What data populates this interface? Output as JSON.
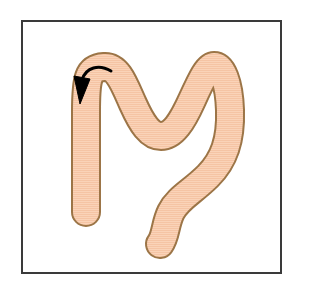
{
  "figure": {
    "title": "Anatomical diagram of a tubular organ with directional flow arrow",
    "caption": "",
    "background_color": "#ffffff"
  },
  "frame": {
    "name": "figure-border",
    "x": 21,
    "y": 20,
    "width": 261,
    "height": 254,
    "stroke_color": "#3a3a3a",
    "stroke_width": 2,
    "fill_color": "#ffffff"
  },
  "organ": {
    "label": "colon-tube-shape",
    "fill_color": "#fad3b8",
    "stroke_color": "#9c7547",
    "stroke_width": 2,
    "hatch_color": "#f3bfa0",
    "hatch_spacing": 2,
    "tube_width": 26,
    "path_points": [
      {
        "x": 86,
        "y": 212
      },
      {
        "x": 86,
        "y": 110
      },
      {
        "x": 86,
        "y": 74
      },
      {
        "x": 112,
        "y": 70
      },
      {
        "x": 126,
        "y": 96
      },
      {
        "x": 148,
        "y": 132
      },
      {
        "x": 172,
        "y": 130
      },
      {
        "x": 196,
        "y": 98
      },
      {
        "x": 212,
        "y": 70
      },
      {
        "x": 226,
        "y": 86
      },
      {
        "x": 228,
        "y": 130
      },
      {
        "x": 214,
        "y": 164
      },
      {
        "x": 186,
        "y": 190
      },
      {
        "x": 170,
        "y": 208
      },
      {
        "x": 164,
        "y": 232
      },
      {
        "x": 156,
        "y": 246
      }
    ],
    "end_cap_style": "round"
  },
  "arrow": {
    "label": "flow-direction-arrow",
    "color": "#000000",
    "stroke_width": 3,
    "start": {
      "x": 110,
      "y": 72
    },
    "control": {
      "x": 92,
      "y": 62
    },
    "end": {
      "x": 81,
      "y": 82
    },
    "head_tip": {
      "x": 79,
      "y": 103
    },
    "head_width": 13,
    "head_length": 18,
    "direction": "counterclockwise-down-left"
  },
  "colors": {
    "fill": "#fad3b8",
    "outline": "#9c7547",
    "frame": "#3a3a3a",
    "arrow": "#000000",
    "background": "#ffffff"
  }
}
